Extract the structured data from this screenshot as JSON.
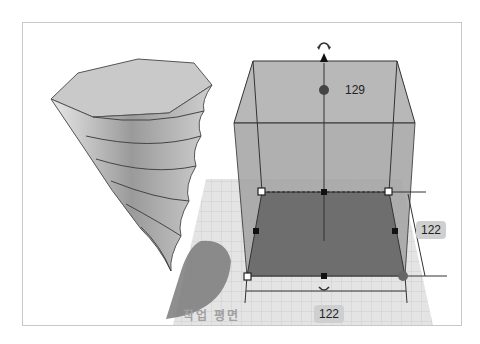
{
  "viewport": {
    "workplane_label": "작업 평면",
    "object_height": "129",
    "dimension_depth": "122",
    "dimension_width": "122",
    "colors": {
      "workplane_grid": "#d9d9d9",
      "box_fill": "#a8a8a8",
      "box_bottom": "#6e6e6e",
      "shadow": "#7a7a7a",
      "label_bg": "#cfcfcf"
    },
    "icons": {
      "rotate_top": "rotate-arrows-icon",
      "rotate_bottom": "rotate-arrows-icon",
      "height_handle": "cone-handle-icon"
    }
  }
}
